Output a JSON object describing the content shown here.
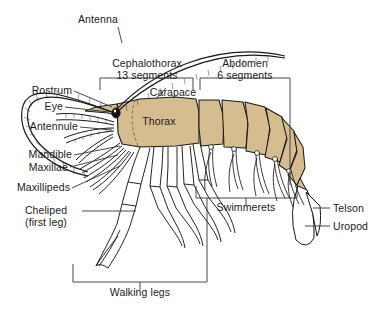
{
  "figure": {
    "kind": "anatomical-diagram",
    "background_color": "#ffffff",
    "body_fill_color": "#d6bd8f",
    "outline_color": "#1a1a1a",
    "leader_color": "#333333"
  },
  "labels": {
    "antenna": "Antenna",
    "rostrum": "Rostrum",
    "eye": "Eye",
    "antennule": "Antennule",
    "mandible": "Mandible",
    "maxillae": "Maxillae",
    "maxillipeds": "Maxillipeds",
    "cheliped_line1": "Cheliped",
    "cheliped_line2": "(first leg)",
    "cephalothorax_line1": "Cephalothorax",
    "cephalothorax_line2": "13 segments",
    "carapace": "Carapace",
    "thorax": "Thorax",
    "abdomen_line1": "Abdomen",
    "abdomen_line2": "6 segments",
    "swimmerets": "Swimmerets",
    "telson": "Telson",
    "uropod": "Uropod",
    "walking_legs": "Walking legs"
  },
  "brackets": [
    {
      "name": "cephalothorax-bracket",
      "label": "Cephalothorax 13 segments",
      "orientation": "top"
    },
    {
      "name": "abdomen-bracket",
      "label": "Abdomen 6 segments",
      "orientation": "top"
    },
    {
      "name": "swimmerets-bracket",
      "label": "Swimmerets",
      "orientation": "bottom"
    },
    {
      "name": "walking-legs-bracket",
      "label": "Walking legs",
      "orientation": "bottom"
    }
  ],
  "body_parts": [
    "antenna",
    "rostrum",
    "eye",
    "antennule",
    "mandible",
    "maxillae",
    "maxillipeds",
    "cheliped",
    "carapace",
    "thorax",
    "abdomen",
    "swimmerets",
    "telson",
    "uropod",
    "walking legs"
  ]
}
